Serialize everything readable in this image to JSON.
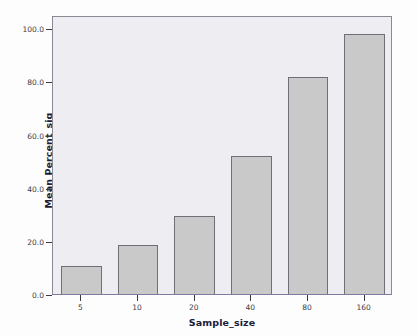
{
  "chart_data": {
    "type": "bar",
    "title": "",
    "subtitle": "",
    "xlabel": "Sample_size",
    "ylabel": "Mean Percent_sig",
    "categories": [
      "5",
      "10",
      "20",
      "40",
      "80",
      "160"
    ],
    "values": [
      10.6,
      18.5,
      29.5,
      52.0,
      81.5,
      98.0
    ],
    "series": [
      {
        "name": "Mean Percent_sig",
        "values": [
          10.6,
          18.5,
          29.5,
          52.0,
          81.5,
          98.0
        ]
      }
    ],
    "xtick_labels": [
      "5",
      "10",
      "20",
      "40",
      "80",
      "160"
    ],
    "ytick_labels": [
      "0.0",
      "20.0",
      "40.0",
      "60.0",
      "80.0",
      "100.0"
    ],
    "ytick_values": [
      0,
      20,
      40,
      60,
      80,
      100
    ],
    "ylim": [
      0,
      105
    ],
    "grid": false,
    "legend": "none",
    "colors": {
      "bar_fill": "#c9c9c9",
      "bar_border": "#6f6f78",
      "plot_background": "#eeeef2",
      "axis_title": "#1b1b3a",
      "tick_label": "#3a3a46",
      "frame": "#8a8a96"
    }
  }
}
